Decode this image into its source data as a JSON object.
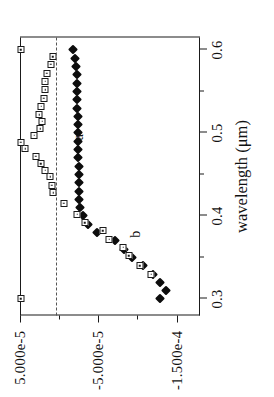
{
  "chart_data": {
    "type": "scatter",
    "title": "",
    "subtitle": "",
    "xlabel": "wavelength (μm)",
    "ylabel": "",
    "xlim": [
      0.28,
      0.615
    ],
    "ylim": [
      -0.00018,
      5e-05
    ],
    "grid": false,
    "legend_position": "inline-annotations",
    "xticks": [
      0.3,
      0.4,
      0.5,
      0.6
    ],
    "xtick_labels": [
      "0.3",
      "0.4",
      "0.5",
      "0.6"
    ],
    "xticks_minor": [
      0.35,
      0.45,
      0.55
    ],
    "yticks": [
      5e-05,
      -5e-05,
      -0.00015
    ],
    "ytick_labels": [
      "5.000e-5",
      "-5.000e-5",
      "-1.500e-4"
    ],
    "yticks_minor": [
      0.0,
      -0.0001
    ],
    "reference_line": {
      "y": 0.0,
      "style": "dashed"
    },
    "annotations": [
      {
        "text": "a",
        "x": 0.495,
        "y": -2.55e-05
      },
      {
        "text": "b",
        "x": 0.378,
        "y": -9.85e-05
      }
    ],
    "series": [
      {
        "name": "a",
        "marker": "filled-diamond",
        "color": "#0d0d0d",
        "x": [
          0.3,
          0.31,
          0.32,
          0.33,
          0.34,
          0.35,
          0.36,
          0.37,
          0.38,
          0.39,
          0.4,
          0.41,
          0.42,
          0.43,
          0.44,
          0.45,
          0.46,
          0.47,
          0.48,
          0.49,
          0.5,
          0.51,
          0.52,
          0.53,
          0.54,
          0.55,
          0.56,
          0.57,
          0.58,
          0.59,
          0.6
        ],
        "y": [
          -0.000129,
          -0.0001365,
          -0.0001295,
          -0.00012,
          -0.0001075,
          -9.35e-05,
          -8.3e-05,
          -7.2e-05,
          -4.9e-05,
          -3.65e-05,
          -3e-05,
          -2.7e-05,
          -2.6e-05,
          -2.55e-05,
          -2.5e-05,
          -2.5e-05,
          -2.48e-05,
          -2.45e-05,
          -2.45e-05,
          -2.42e-05,
          -2.4e-05,
          -2.38e-05,
          -2.35e-05,
          -2.32e-05,
          -2.3e-05,
          -2.28e-05,
          -2.25e-05,
          -2.22e-05,
          -2.15e-05,
          -2.05e-05,
          -1.8e-05
        ]
      },
      {
        "name": "b",
        "marker": "open-square",
        "color": "#1a1a1a",
        "x": [
          0.3,
          0.33,
          0.34,
          0.352,
          0.362,
          0.372,
          0.382,
          0.392,
          0.402,
          0.415,
          0.428,
          0.437,
          0.447,
          0.455,
          0.463,
          0.472,
          0.481,
          0.489,
          0.497,
          0.505,
          0.514,
          0.522,
          0.532,
          0.542,
          0.552,
          0.562,
          0.572,
          0.583,
          0.592,
          0.6
        ],
        "y": [
          4.9e-05,
          -0.0001175,
          -0.000103,
          -8.9e-05,
          -8.2e-05,
          -6.4e-05,
          -5.55e-05,
          -3.3e-05,
          -2.3e-05,
          -6e-06,
          7.5e-06,
          9.5e-06,
          1.15e-05,
          1.75e-05,
          2.35e-05,
          3e-05,
          4.35e-05,
          4.9e-05,
          3.2e-05,
          2.4e-05,
          2.15e-05,
          2.55e-05,
          2.3e-05,
          1.95e-05,
          1.75e-05,
          1.75e-05,
          1.6e-05,
          1.1e-05,
          8e-06,
          4.9e-05
        ]
      }
    ]
  }
}
